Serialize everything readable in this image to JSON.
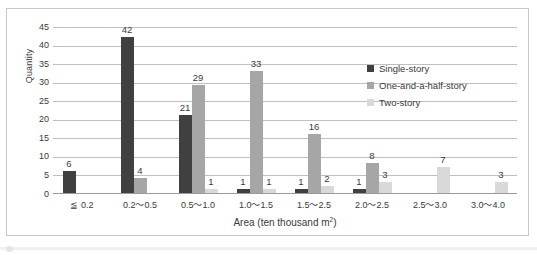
{
  "chart_data": {
    "type": "bar",
    "title": "",
    "xlabel": "Area (ten thousand m²)",
    "xlabel_base": "Area (ten thousand m",
    "xlabel_sup": "2",
    "xlabel_tail": ")",
    "ylabel": "Quantity",
    "ylim": [
      0,
      45
    ],
    "ytick_step": 5,
    "yticks": [
      "45",
      "40",
      "35",
      "30",
      "25",
      "20",
      "15",
      "10",
      "5",
      "0"
    ],
    "grid": true,
    "legend_position": "inside-top-right",
    "categories": [
      "≦ 0.2",
      "0.2～0.5",
      "0.5～1.0",
      "1.0～1.5",
      "1.5～2.5",
      "2.0～2.5",
      "2.5～3.0",
      "3.0～4.0"
    ],
    "series": [
      {
        "name": "Single-story",
        "color": "#404040",
        "values": [
          6,
          42,
          21,
          1,
          1,
          1,
          null,
          null
        ]
      },
      {
        "name": "One-and-a-half-story",
        "color": "#a6a6a6",
        "values": [
          null,
          4,
          29,
          33,
          16,
          8,
          null,
          null
        ]
      },
      {
        "name": "Two-story",
        "color": "#d9d9d9",
        "values": [
          null,
          null,
          1,
          1,
          2,
          3,
          7,
          3
        ]
      }
    ],
    "data_labels": [
      [
        "6",
        null,
        null
      ],
      [
        "42",
        "4",
        null
      ],
      [
        "21",
        "29",
        "1"
      ],
      [
        "1",
        "33",
        "1"
      ],
      [
        "1",
        "16",
        "2"
      ],
      [
        "1",
        "8",
        "3"
      ],
      [
        null,
        null,
        "7"
      ],
      [
        null,
        null,
        "3"
      ]
    ]
  },
  "legend": {
    "items": [
      {
        "label": "Single-story"
      },
      {
        "label": "One-and-a-half-story"
      },
      {
        "label": "Two-story"
      }
    ]
  },
  "colors": {
    "series_dark": "#404040",
    "series_medium": "#a6a6a6",
    "series_light": "#d9d9d9",
    "gridline": "#bfbfbf",
    "frame_border": "#c9c9c9",
    "text": "#3a3a3a",
    "background": "#ffffff"
  }
}
